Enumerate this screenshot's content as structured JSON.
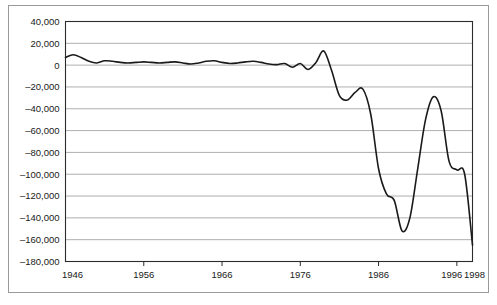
{
  "chart_data": {
    "type": "line",
    "title": "",
    "subtitle": "",
    "xlabel": "",
    "ylabel": "",
    "xlim": [
      1946,
      1998
    ],
    "ylim": [
      -180000,
      40000
    ],
    "grid": true,
    "legend": false,
    "y_ticks": [
      40000,
      20000,
      0,
      -20000,
      -40000,
      -60000,
      -80000,
      -100000,
      -120000,
      -140000,
      -160000,
      -180000
    ],
    "y_tick_labels": [
      "40,000",
      "20,000",
      "0",
      "–20,000",
      "–40,000",
      "–60,000",
      "–80,000",
      "–100,000",
      "–120,000",
      "–140,000",
      "–160,000",
      "–180,000"
    ],
    "x_ticks": [
      1946,
      1956,
      1966,
      1976,
      1986,
      1996,
      1998
    ],
    "x_tick_labels": [
      "1946",
      "1956",
      "1966",
      "1976",
      "1986",
      "1996",
      "1998"
    ],
    "series": [
      {
        "name": "series-1",
        "color": "#1a1a1a",
        "x": [
          1946,
          1947,
          1948,
          1949,
          1950,
          1951,
          1952,
          1953,
          1954,
          1955,
          1956,
          1957,
          1958,
          1959,
          1960,
          1961,
          1962,
          1963,
          1964,
          1965,
          1966,
          1967,
          1968,
          1969,
          1970,
          1971,
          1972,
          1973,
          1974,
          1975,
          1976,
          1977,
          1978,
          1979,
          1980,
          1981,
          1982,
          1983,
          1984,
          1985,
          1986,
          1987,
          1988,
          1989,
          1990,
          1991,
          1992,
          1993,
          1994,
          1995,
          1996,
          1997,
          1998
        ],
        "values": [
          7000,
          9500,
          7000,
          3500,
          2000,
          4000,
          3500,
          2500,
          2000,
          2500,
          3000,
          2500,
          2000,
          2500,
          3000,
          2000,
          1000,
          2000,
          3500,
          4000,
          2500,
          1500,
          2000,
          3000,
          3500,
          2500,
          1000,
          500,
          1500,
          -2000,
          1500,
          -4000,
          2500,
          13000,
          -5000,
          -28000,
          -32000,
          -25000,
          -22000,
          -45000,
          -95000,
          -118000,
          -124000,
          -152000,
          -140000,
          -95000,
          -50000,
          -29000,
          -42000,
          -88000,
          -96000,
          -100000,
          -165000
        ]
      }
    ]
  },
  "axis": {
    "y_axis_name": "y-axis",
    "x_axis_name": "x-axis"
  }
}
